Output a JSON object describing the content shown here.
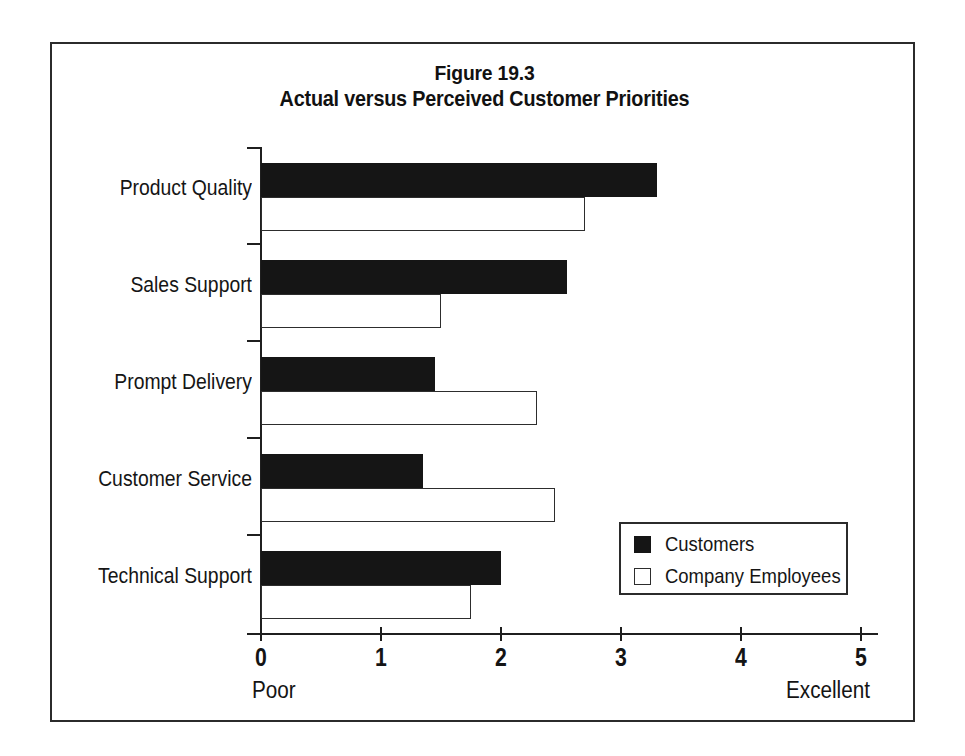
{
  "figure": {
    "title_line1": "Figure 19.3",
    "title_line2": "Actual versus Perceived Customer Priorities"
  },
  "legend": {
    "customers_label": "Customers",
    "employees_label": "Company Employees",
    "customers_swatch": "filled-black-square-icon",
    "employees_swatch": "hollow-white-square-icon"
  },
  "axis": {
    "low_endpoint": "Poor",
    "high_endpoint": "Excellent",
    "tick_0": "0",
    "tick_1": "1",
    "tick_2": "2",
    "tick_3": "3",
    "tick_4": "4",
    "tick_5": "5"
  },
  "categories": {
    "c0": "Product Quality",
    "c1": "Sales Support",
    "c2": "Prompt Delivery",
    "c3": "Customer Service",
    "c4": "Technical Support"
  },
  "chart_data": {
    "type": "bar",
    "orientation": "horizontal",
    "title": "Figure 19.3\nActual versus Perceived Customer Priorities",
    "xlabel": "",
    "ylabel": "",
    "xlim": [
      0,
      5
    ],
    "xticks": [
      0,
      1,
      2,
      3,
      4,
      5
    ],
    "xtick_labels": [
      "0",
      "1",
      "2",
      "3",
      "4",
      "5"
    ],
    "x_axis_endpoint_labels": {
      "low": "Poor",
      "high": "Excellent"
    },
    "grid": false,
    "legend_position": "lower-right-inside",
    "categories": [
      "Product Quality",
      "Sales Support",
      "Prompt Delivery",
      "Customer Service",
      "Technical Support"
    ],
    "series": [
      {
        "name": "Customers",
        "color": "#151515",
        "style": "filled",
        "values": [
          3.3,
          2.55,
          1.45,
          1.35,
          2.0
        ]
      },
      {
        "name": "Company Employees",
        "color": "#ffffff",
        "style": "outlined",
        "values": [
          2.7,
          1.5,
          2.3,
          2.45,
          1.75
        ]
      }
    ]
  },
  "colors": {
    "ink": "#1a1a1a",
    "frame": "#2b2b2b",
    "bar_filled": "#151515",
    "bar_outline": "#2d2d2d",
    "background": "#ffffff"
  }
}
